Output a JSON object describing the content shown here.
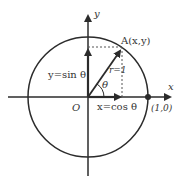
{
  "caption": "",
  "labels": {
    "y_axis": "y",
    "x_axis": "x",
    "point_a": "A(x,y)",
    "radius": "r=1",
    "theta": "θ",
    "sin_label": "y=sin θ",
    "cos_label": "x=cos θ",
    "origin": "O",
    "unit_point": "(1,0)"
  },
  "geometry": {
    "center": [
      88,
      97
    ],
    "radius": 60,
    "angle_deg": 55
  },
  "colors": {
    "stroke": "#2b2b2b",
    "dashed": "#555555",
    "text": "#333333"
  }
}
